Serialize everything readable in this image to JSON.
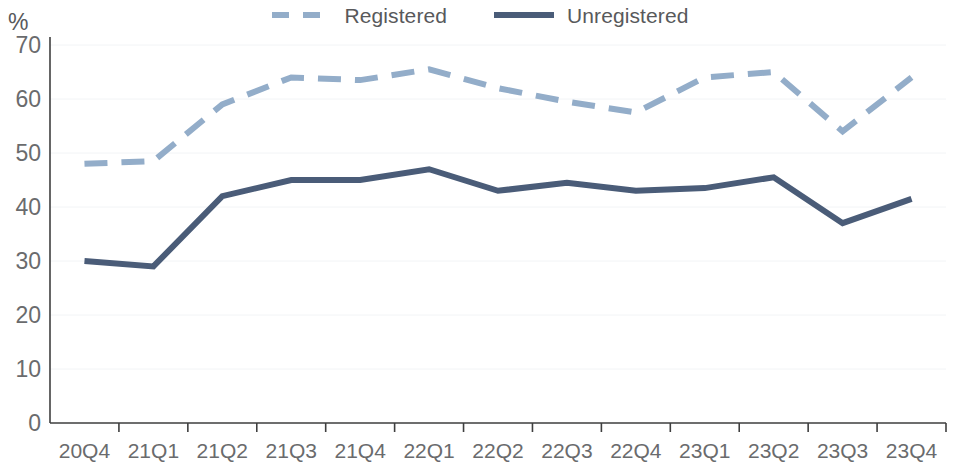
{
  "legend": {
    "items": [
      {
        "label": "Registered",
        "color": "#93adc9",
        "style": "dashed"
      },
      {
        "label": "Unregistered",
        "color": "#4a5c78",
        "style": "solid"
      }
    ]
  },
  "axis": {
    "y_unit_label": "%",
    "y_ticks": [
      "70",
      "60",
      "50",
      "40",
      "30",
      "20",
      "10",
      "0"
    ],
    "x_ticks": [
      "20Q4",
      "21Q1",
      "21Q2",
      "21Q3",
      "21Q4",
      "22Q1",
      "22Q2",
      "22Q3",
      "22Q4",
      "23Q1",
      "23Q2",
      "23Q3",
      "23Q4"
    ]
  },
  "colors": {
    "registered": "#93adc9",
    "unregistered": "#4a5c78",
    "axis": "#3f3f3f",
    "gridline": "#f2f4f6",
    "tick_text": "#6a6b6d"
  },
  "chart_data": {
    "type": "line",
    "title": "",
    "xlabel": "",
    "ylabel": "%",
    "ylim": [
      0,
      70
    ],
    "ytick_step": 10,
    "grid": false,
    "legend_position": "top-center",
    "categories": [
      "20Q4",
      "21Q1",
      "21Q2",
      "21Q3",
      "21Q4",
      "22Q1",
      "22Q2",
      "22Q3",
      "22Q4",
      "23Q1",
      "23Q2",
      "23Q3",
      "23Q4"
    ],
    "series": [
      {
        "name": "Registered",
        "color": "#93adc9",
        "line_style": "dashed",
        "values": [
          48,
          48.5,
          59,
          64,
          63.5,
          65.5,
          62,
          59.5,
          57.5,
          64,
          65,
          54,
          64
        ]
      },
      {
        "name": "Unregistered",
        "color": "#4a5c78",
        "line_style": "solid",
        "values": [
          30,
          29,
          42,
          45,
          45,
          47,
          43,
          44.5,
          43,
          43.5,
          45.5,
          37,
          41.5
        ]
      }
    ]
  }
}
